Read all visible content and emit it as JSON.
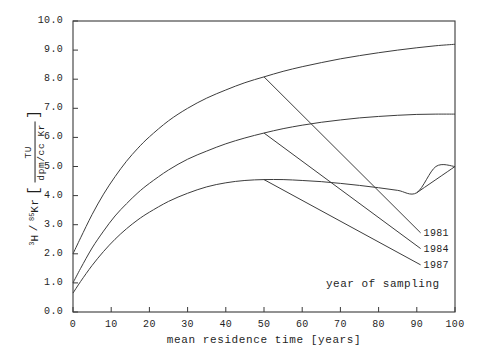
{
  "chart_data": {
    "type": "line",
    "title": "",
    "xlabel": "mean residence time  [years]",
    "ylabel_parts": {
      "numerator_left": "3",
      "species_1": "H",
      "slash": "/",
      "numerator_right": "85",
      "species_2": "Kr",
      "bracket_open": "[",
      "frac_num": "TU",
      "frac_den": "dpm/cc Kr",
      "bracket_close": "]"
    },
    "ylabel_plain": "3H / 85Kr [TU/(dpm/cc Kr)]",
    "xlim": [
      0,
      100
    ],
    "ylim": [
      0,
      10
    ],
    "xticks": [
      0,
      10,
      20,
      30,
      40,
      50,
      60,
      70,
      80,
      90,
      100
    ],
    "xtick_labels": [
      "0",
      "10",
      "20",
      "30",
      "40",
      "50",
      "60",
      "70",
      "80",
      "90",
      "100"
    ],
    "yticks": [
      0,
      1,
      2,
      3,
      4,
      5,
      6,
      7,
      8,
      9,
      10
    ],
    "ytick_labels": [
      "0.0",
      "1.0",
      "2.0",
      "3.0",
      "4.0",
      "5.0",
      "6.0",
      "7.0",
      "8.0",
      "9.0",
      "10.0"
    ],
    "grid": false,
    "legend_position": "inside-bottom-right",
    "legend_caption": "year of sampling",
    "series": [
      {
        "name": "1981",
        "label": "1981",
        "color": "#3d3d3d",
        "x": [
          0,
          2,
          5,
          8,
          11,
          14,
          17,
          20,
          25,
          30,
          35,
          40,
          45,
          50,
          55,
          60,
          65,
          70,
          75,
          80,
          85,
          90,
          95,
          100
        ],
        "values": [
          2.0,
          2.55,
          3.35,
          4.05,
          4.65,
          5.18,
          5.63,
          6.02,
          6.57,
          7.0,
          7.35,
          7.63,
          7.88,
          8.08,
          8.27,
          8.43,
          8.57,
          8.7,
          8.81,
          8.91,
          9.0,
          9.08,
          9.15,
          9.2
        ],
        "leader": {
          "x0": 50,
          "y0": 8.08,
          "x1": 91,
          "y1": 2.72
        }
      },
      {
        "name": "1984",
        "label": "1984",
        "color": "#3d3d3d",
        "x": [
          0,
          2,
          5,
          8,
          11,
          14,
          17,
          20,
          25,
          30,
          35,
          40,
          45,
          50,
          55,
          60,
          65,
          70,
          75,
          80,
          85,
          90,
          95,
          100
        ],
        "values": [
          1.0,
          1.5,
          2.2,
          2.78,
          3.3,
          3.72,
          4.1,
          4.42,
          4.88,
          5.25,
          5.53,
          5.78,
          5.98,
          6.15,
          6.3,
          6.42,
          6.52,
          6.6,
          6.67,
          6.72,
          6.76,
          6.79,
          6.8,
          6.8
        ],
        "leader": {
          "x0": 50,
          "y0": 6.15,
          "x1": 91,
          "y1": 2.18
        }
      },
      {
        "name": "1987",
        "label": "1987",
        "color": "#3d3d3d",
        "x": [
          0,
          2,
          5,
          8,
          11,
          14,
          17,
          20,
          25,
          30,
          35,
          40,
          45,
          50,
          55,
          60,
          65,
          70,
          75,
          80,
          85,
          90,
          95,
          100
        ],
        "values": [
          0.65,
          1.05,
          1.6,
          2.08,
          2.5,
          2.86,
          3.17,
          3.43,
          3.8,
          4.08,
          4.3,
          4.44,
          4.52,
          4.55,
          4.55,
          4.52,
          4.48,
          4.42,
          4.35,
          4.27,
          4.18,
          4.1,
          5.0,
          5.0
        ],
        "leader": {
          "x0": 50,
          "y0": 4.55,
          "x1": 91,
          "y1": 1.62
        }
      }
    ],
    "extra_segments": [
      {
        "name": "1987-tail",
        "x": [
          90,
          100
        ],
        "values": [
          4.1,
          5.0
        ],
        "note": "upper-right continuation of lowest curve toward right axis"
      }
    ],
    "axis_color": "#3a3a3a",
    "line_color": "#3d3d3d",
    "background_color": "#ffffff"
  }
}
